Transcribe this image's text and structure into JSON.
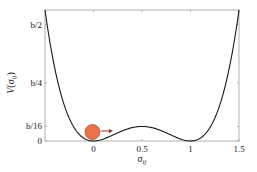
{
  "chart_data": {
    "type": "line",
    "title": "",
    "xlabel": "σ_ij",
    "ylabel": "V(σ_ij)",
    "xlim": [
      -0.5,
      1.5
    ],
    "ylim_b": [
      0,
      0.5625
    ],
    "x_ticks": [
      0,
      0.5,
      1,
      1.5
    ],
    "x_tick_labels": [
      "0",
      "0.5",
      "1",
      "1.5"
    ],
    "y_ticks_b": [
      0,
      0.0625,
      0.25,
      0.5
    ],
    "y_tick_labels": [
      "0",
      "b/16",
      "b/4",
      "b/2"
    ],
    "grid": false,
    "legend": null,
    "series": [
      {
        "name": "double-well potential V = b·σ²(1−σ)²",
        "x": [
          -0.5,
          -0.4,
          -0.3,
          -0.2,
          -0.1,
          0,
          0.1,
          0.2,
          0.3,
          0.4,
          0.5,
          0.6,
          0.7,
          0.8,
          0.9,
          1.0,
          1.1,
          1.2,
          1.3,
          1.4,
          1.5
        ],
        "y_b": [
          0.5625,
          0.3136,
          0.1521,
          0.0576,
          0.0121,
          0,
          0.0081,
          0.0256,
          0.0441,
          0.0576,
          0.0625,
          0.0576,
          0.0441,
          0.0256,
          0.0081,
          0,
          0.0121,
          0.0576,
          0.1521,
          0.3136,
          0.5625
        ],
        "color": "#1a1a1a"
      }
    ],
    "annotations": [
      {
        "type": "ball",
        "x": 0,
        "color": "#E8734A",
        "outline": "#C0502A"
      },
      {
        "type": "arrow",
        "from_x": 0.06,
        "to_x": 0.17,
        "direction": "right",
        "color": "#8B2E1A"
      }
    ]
  },
  "labels": {
    "xlabel_main": "σ",
    "xlabel_sub": "ij",
    "ylabel_main": "V",
    "ylabel_paren_open": "(",
    "ylabel_sigma": "σ",
    "ylabel_sub": "ij",
    "ylabel_paren_close": ")"
  },
  "colors": {
    "curve": "#1a1a1a",
    "axis": "#b0b0b0",
    "ball_fill": "#E8734A",
    "ball_stroke": "#C0502A",
    "arrow": "#8B2E1A"
  }
}
